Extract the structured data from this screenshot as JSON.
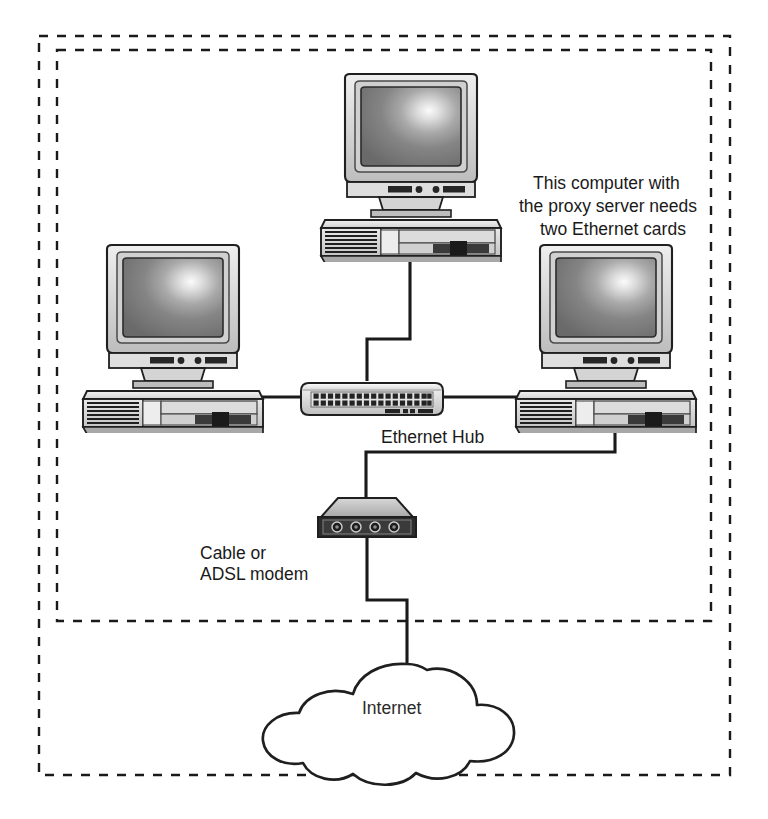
{
  "diagram": {
    "type": "network-topology",
    "background_color": "#ffffff",
    "boundaries": [
      {
        "name": "outer-boundary",
        "style": "dashed",
        "color": "#1a1a1a",
        "meaning": "diagram frame"
      },
      {
        "name": "lan-boundary",
        "style": "dashed",
        "color": "#1a1a1a",
        "meaning": "local area network / home premises"
      }
    ],
    "nodes": [
      {
        "id": "pc-top",
        "icon": "desktop-computer-icon",
        "label": "",
        "role": "workstation"
      },
      {
        "id": "pc-left",
        "icon": "desktop-computer-icon",
        "label": "",
        "role": "workstation"
      },
      {
        "id": "pc-right",
        "icon": "desktop-computer-icon",
        "label": "",
        "role": "proxy-server"
      },
      {
        "id": "hub",
        "icon": "ethernet-hub-icon",
        "label": "Ethernet Hub",
        "role": "network-hub",
        "ports": 34,
        "port_rows": 2
      },
      {
        "id": "modem",
        "icon": "modem-icon",
        "label": "Cable or\nADSL modem",
        "label_line_1": "Cable or",
        "label_line_2": "ADSL modem",
        "role": "broadband-modem",
        "indicator_lights": 4
      },
      {
        "id": "internet",
        "icon": "cloud-icon",
        "label": "Internet",
        "role": "wide-area-network"
      }
    ],
    "annotations": [
      {
        "id": "proxy-note",
        "target": "pc-right",
        "line_1": "This computer with",
        "line_2": "the proxy server needs",
        "line_3": "two Ethernet cards"
      }
    ],
    "links": [
      {
        "from": "pc-top",
        "to": "hub",
        "medium": "ethernet"
      },
      {
        "from": "pc-left",
        "to": "hub",
        "medium": "ethernet"
      },
      {
        "from": "pc-right",
        "to": "hub",
        "medium": "ethernet"
      },
      {
        "from": "pc-right",
        "to": "modem",
        "medium": "ethernet"
      },
      {
        "from": "modem",
        "to": "internet",
        "medium": "broadband"
      }
    ],
    "colors": {
      "line": "#1a1a1a",
      "chassis_light": "#e8e8e8",
      "chassis_mid": "#c9c9c9",
      "chassis_dark": "#9a9a9a",
      "screen_dark": "#6e6e6e",
      "screen_highlight": "#f2f2f2",
      "port_dark": "#2a2a2a"
    }
  }
}
